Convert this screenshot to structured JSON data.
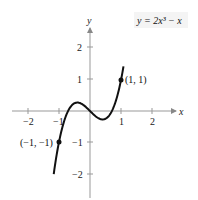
{
  "chart_data": {
    "type": "line",
    "title": "",
    "equation_label": "y = 2x³ − x",
    "xlabel": "x",
    "ylabel": "y",
    "xlim": [
      -2.5,
      2.5
    ],
    "ylim": [
      -2.5,
      2.5
    ],
    "x_ticks": [
      -2,
      -1,
      1,
      2
    ],
    "x_tick_labels": [
      "−2",
      "−1",
      "1",
      "2"
    ],
    "y_ticks": [
      -2,
      -1,
      1,
      2
    ],
    "y_tick_labels": [
      "−2",
      "−1",
      "1",
      "2"
    ],
    "grid": false,
    "series": [
      {
        "name": "y = 2x^3 - x",
        "function": "2x^3 - x",
        "x_range": [
          -1.17,
          1.08
        ],
        "points": [
          {
            "x": -1.1,
            "y": -1.562
          },
          {
            "x": -1.0,
            "y": -1.0
          },
          {
            "x": -0.8,
            "y": -0.224
          },
          {
            "x": -0.6,
            "y": 0.168
          },
          {
            "x": -0.408,
            "y": 0.272
          },
          {
            "x": -0.2,
            "y": 0.184
          },
          {
            "x": 0.0,
            "y": 0.0
          },
          {
            "x": 0.2,
            "y": -0.184
          },
          {
            "x": 0.408,
            "y": -0.272
          },
          {
            "x": 0.6,
            "y": -0.168
          },
          {
            "x": 0.8,
            "y": 0.224
          },
          {
            "x": 1.0,
            "y": 1.0
          }
        ]
      }
    ],
    "annotations": [
      {
        "x": 1,
        "y": 1,
        "label": "(1, 1)"
      },
      {
        "x": -1,
        "y": -1,
        "label": "(−1, −1)"
      }
    ]
  }
}
